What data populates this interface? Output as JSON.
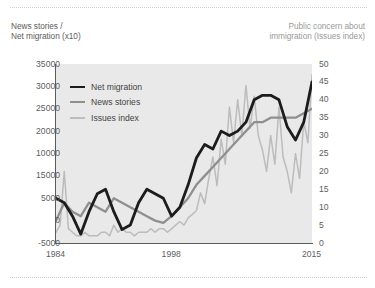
{
  "figure": {
    "background": "#ffffff",
    "plot_background": "#e9e9e9",
    "axis_color": "#5a5a5a"
  },
  "header": {
    "left_axis_title": "News stories /\nNet migration (x10)",
    "right_axis_title": "Public concern about\nimmigration (Issues index)"
  },
  "legend": {
    "items": [
      {
        "label": "Net migration",
        "color": "#1c1c1c",
        "width": 2.6
      },
      {
        "label": "News stories",
        "color": "#8f8f8f",
        "width": 2.2
      },
      {
        "label": "Issues index",
        "color": "#bcbcbc",
        "width": 2.2
      }
    ]
  },
  "chart_data": {
    "type": "line",
    "title": "",
    "subtitle": "",
    "xlabel": "",
    "ylabel": "News stories / Net migration (x10)",
    "y2label": "Public concern about immigration (Issues index)",
    "grid": false,
    "legend_position": "inside-top-left",
    "xlim": [
      1984,
      2015
    ],
    "x_ticks": [
      "1984",
      "1998",
      "2015"
    ],
    "x_tick_values": [
      1984,
      1998,
      2015
    ],
    "ylim": [
      -5000,
      35000
    ],
    "y_ticks": [
      "35000",
      "30000",
      "25000",
      "20000",
      "10000",
      "15000",
      "5000",
      "0",
      "-5000"
    ],
    "y_tick_values": [
      35000,
      30000,
      25000,
      20000,
      15000,
      10000,
      5000,
      0,
      -5000
    ],
    "y2lim": [
      0,
      50
    ],
    "y2_ticks": [
      "50",
      "45",
      "40",
      "35",
      "30",
      "25",
      "20",
      "15",
      "10",
      "5",
      "0"
    ],
    "y2_tick_values": [
      50,
      45,
      40,
      35,
      30,
      25,
      20,
      15,
      10,
      5,
      0
    ],
    "series": [
      {
        "name": "Net migration",
        "axis": "left",
        "color": "#1c1c1c",
        "x": [
          1984,
          1985,
          1986,
          1987,
          1988,
          1989,
          1990,
          1991,
          1992,
          1993,
          1994,
          1995,
          1996,
          1997,
          1998,
          1999,
          2000,
          2001,
          2002,
          2003,
          2004,
          2005,
          2006,
          2007,
          2008,
          2009,
          2010,
          2011,
          2012,
          2013,
          2014,
          2015
        ],
        "values": [
          5000,
          4000,
          1000,
          -3000,
          2000,
          6000,
          7000,
          2000,
          -2000,
          -1000,
          4000,
          7000,
          6000,
          5000,
          1000,
          3000,
          8000,
          14000,
          17000,
          16000,
          20000,
          19000,
          20000,
          22000,
          27000,
          28000,
          28000,
          27000,
          21000,
          18000,
          22000,
          31000
        ]
      },
      {
        "name": "News stories",
        "axis": "left",
        "color": "#8f8f8f",
        "x": [
          1984,
          1985,
          1986,
          1987,
          1988,
          1989,
          1990,
          1991,
          1992,
          1993,
          1994,
          1995,
          1996,
          1997,
          1998,
          1999,
          2000,
          2001,
          2002,
          2003,
          2004,
          2005,
          2006,
          2007,
          2008,
          2009,
          2010,
          2011,
          2012,
          2013,
          2014,
          2015
        ],
        "values": [
          0,
          4000,
          2000,
          1000,
          4000,
          3000,
          2000,
          5000,
          4000,
          3000,
          2000,
          1000,
          0,
          -500,
          1000,
          3000,
          5000,
          8000,
          10000,
          12000,
          14000,
          16000,
          18000,
          20000,
          22000,
          22000,
          23000,
          23000,
          23000,
          23000,
          24000,
          25000
        ]
      },
      {
        "name": "Issues index",
        "axis": "right",
        "color": "#bcbcbc",
        "note": "monthly series, highly volatile",
        "x": [
          1984,
          1984.5,
          1985,
          1985.5,
          1986,
          1986.5,
          1987,
          1987.5,
          1988,
          1988.5,
          1989,
          1989.5,
          1990,
          1990.5,
          1991,
          1991.5,
          1992,
          1992.5,
          1993,
          1993.5,
          1994,
          1994.5,
          1995,
          1995.5,
          1996,
          1996.5,
          1997,
          1997.5,
          1998,
          1998.5,
          1999,
          1999.5,
          2000,
          2000.5,
          2001,
          2001.5,
          2002,
          2002.5,
          2003,
          2003.5,
          2004,
          2004.5,
          2005,
          2005.5,
          2006,
          2006.5,
          2007,
          2007.5,
          2008,
          2008.5,
          2009,
          2009.5,
          2010,
          2010.5,
          2011,
          2011.5,
          2012,
          2012.5,
          2013,
          2013.5,
          2014,
          2014.5,
          2015
        ],
        "values": [
          3,
          5,
          20,
          4,
          3,
          2,
          2,
          3,
          2,
          2,
          2,
          3,
          3,
          2,
          5,
          3,
          4,
          3,
          3,
          2,
          3,
          3,
          3,
          4,
          3,
          4,
          4,
          3,
          4,
          5,
          6,
          5,
          7,
          8,
          9,
          14,
          11,
          18,
          24,
          16,
          29,
          22,
          38,
          28,
          40,
          30,
          44,
          32,
          41,
          30,
          26,
          20,
          30,
          22,
          38,
          24,
          20,
          14,
          25,
          18,
          34,
          28,
          47
        ]
      }
    ]
  }
}
